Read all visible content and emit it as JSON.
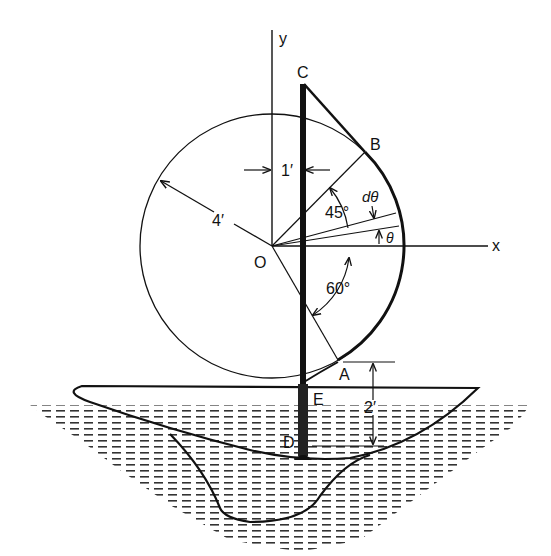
{
  "figure": {
    "type": "engineering-diagram",
    "colors": {
      "ink": "#111111",
      "background": "#ffffff",
      "mast": "#1a1a1a"
    }
  },
  "axes": {
    "x_label": "x",
    "y_label": "y",
    "origin_label": "O"
  },
  "points": {
    "C": "C",
    "B": "B",
    "A": "A",
    "E": "E",
    "D": "D"
  },
  "dimensions": {
    "radius": "4′",
    "mast_offset": "1′",
    "height_A_to_D": "2′"
  },
  "angles": {
    "upper": "45°",
    "lower": "60°",
    "theta": "θ",
    "d_theta": "dθ"
  }
}
